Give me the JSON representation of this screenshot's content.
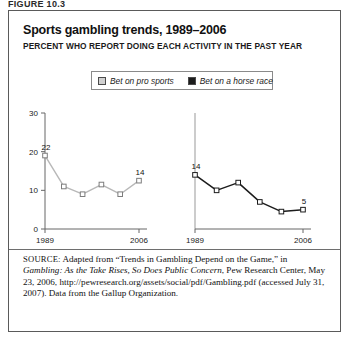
{
  "figure": {
    "label": "FIGURE 10.3",
    "title": "Sports gambling trends, 1989–2006",
    "subtitle": "PERCENT WHO REPORT DOING EACH ACTIVITY IN THE PAST YEAR"
  },
  "legend": {
    "items": [
      {
        "label": "Bet on pro sports",
        "swatch": "#d0d0d0"
      },
      {
        "label": "Bet on a horse race",
        "swatch": "#1c1c1c"
      }
    ]
  },
  "source": {
    "label": "SOURCE:",
    "text_1": " Adapted from “Trends in Gambling Depend on the Game,” in ",
    "italic_1": "Gambling: As the Take Rises, So Does Public Concern",
    "text_2": ", Pew Research Center, May 23, 2006, http://pewresearch.org/assets/social/pdf/Gambling.pdf (accessed July 31, 2007). Data from the Gallup Organization."
  },
  "chart_data": [
    {
      "type": "line",
      "name": "Bet on pro sports",
      "title": "Sports gambling trends, 1989–2006",
      "ylabel": "",
      "xlabel": "",
      "ylim": [
        0,
        30
      ],
      "yticks": [
        0,
        10,
        20,
        30
      ],
      "ytick_labels": [
        "0",
        "10",
        "20",
        "30"
      ],
      "xticks": [
        1989,
        2006
      ],
      "xtick_labels": [
        "1989",
        "2006"
      ],
      "grid": false,
      "color": "#b8b8b8",
      "marker": "open-square",
      "x": [
        1989,
        1992,
        1996,
        1999,
        2003,
        2006
      ],
      "values": [
        19,
        11,
        9,
        11.5,
        9,
        12.5
      ],
      "point_labels": [
        {
          "index": 0,
          "text": "22"
        },
        {
          "index": 5,
          "text": "14"
        }
      ]
    },
    {
      "type": "line",
      "name": "Bet on a horse race",
      "title": "",
      "ylabel": "",
      "xlabel": "",
      "ylim": [
        0,
        30
      ],
      "yticks": [],
      "ytick_labels": [],
      "xticks": [
        1989,
        2006
      ],
      "xtick_labels": [
        "1989",
        "2006"
      ],
      "grid": false,
      "color": "#1c1c1c",
      "marker": "open-square",
      "x": [
        1989,
        1992,
        1996,
        1999,
        2003,
        2006
      ],
      "values": [
        14,
        10,
        12,
        7,
        4.5,
        5
      ],
      "point_labels": [
        {
          "index": 0,
          "text": "14"
        },
        {
          "index": 5,
          "text": "5"
        }
      ]
    }
  ]
}
